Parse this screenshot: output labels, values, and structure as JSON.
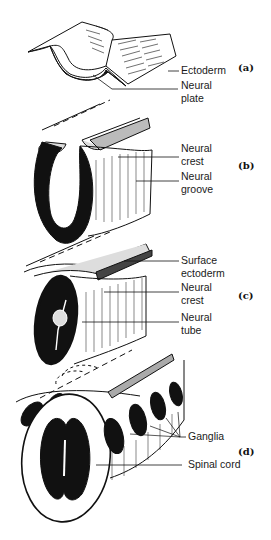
{
  "figure": {
    "panels": [
      {
        "id": "a",
        "tag": "(a)",
        "labels": [
          {
            "text": "Ectoderm"
          },
          {
            "line1": "Neural",
            "line2": "plate"
          }
        ]
      },
      {
        "id": "b",
        "tag": "(b)",
        "labels": [
          {
            "line1": "Neural",
            "line2": "crest"
          },
          {
            "line1": "Neural",
            "line2": "groove"
          }
        ]
      },
      {
        "id": "c",
        "tag": "(c)",
        "labels": [
          {
            "line1": "Surface",
            "line2": "ectoderm"
          },
          {
            "line1": "Neural",
            "line2": "crest"
          },
          {
            "line1": "Neural",
            "line2": "tube"
          }
        ]
      },
      {
        "id": "d",
        "tag": "(d)",
        "labels": [
          {
            "text": "Ganglia"
          },
          {
            "text": "Spinal cord"
          }
        ]
      }
    ]
  }
}
